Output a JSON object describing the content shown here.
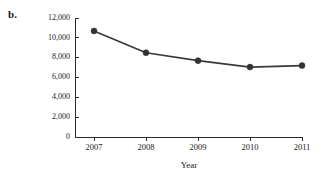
{
  "figure": {
    "panel_label": "b."
  },
  "chart_data": {
    "type": "line",
    "title": "",
    "xlabel": "Year",
    "ylabel": "Retail Value (millions of $)",
    "categories": [
      "2007",
      "2008",
      "2009",
      "2010",
      "2011"
    ],
    "x": [
      2007,
      2008,
      2009,
      2010,
      2011
    ],
    "values": [
      10700,
      8500,
      7700,
      7050,
      7200
    ],
    "series": [
      {
        "name": "Retail Value",
        "values": [
          10700,
          8500,
          7700,
          7050,
          7200
        ],
        "color": "#333333",
        "marker": "circle"
      }
    ],
    "ylim": [
      0,
      12000
    ],
    "yticks": [
      0,
      2000,
      4000,
      6000,
      8000,
      10000,
      12000
    ],
    "ytick_labels": [
      "0",
      "2,000",
      "4,000",
      "6,000",
      "8,000",
      "10,000",
      "12,000"
    ],
    "xticks": [
      2007,
      2008,
      2009,
      2010,
      2011
    ],
    "xtick_labels": [
      "2007",
      "2008",
      "2009",
      "2010",
      "2011"
    ],
    "grid": false,
    "legend": false
  }
}
